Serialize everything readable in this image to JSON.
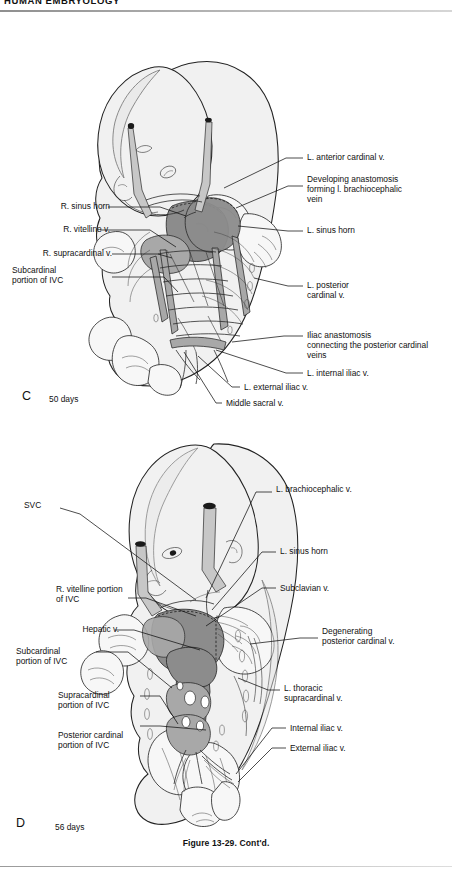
{
  "page": {
    "running_head": "HUMAN EMBRYOLOGY",
    "caption": "Figure 13-29. Cont'd."
  },
  "panels": [
    {
      "letter": "C",
      "days": "50 days",
      "labels_left": [
        {
          "text": "R. sinus horn"
        },
        {
          "text": "R. vitelline v."
        },
        {
          "text": "R. supracardinal v."
        },
        {
          "text": "Subcardinal\nportion of IVC"
        }
      ],
      "labels_right": [
        {
          "text": "L. anterior cardinal v."
        },
        {
          "text": "Developing anastomosis\nforming l. brachiocephalic\nvein"
        },
        {
          "text": "L. sinus horn"
        },
        {
          "text": "L. posterior\ncardinal v."
        },
        {
          "text": "Iliac anastomosis\nconnecting the posterior cardinal\nveins"
        },
        {
          "text": "L. internal iliac v."
        },
        {
          "text": "L. external iliac v."
        },
        {
          "text": "Middle sacral v."
        }
      ]
    },
    {
      "letter": "D",
      "days": "56 days",
      "labels_left": [
        {
          "text": "SVC"
        },
        {
          "text": "R. vitelline portion\nof IVC"
        },
        {
          "text": "Hepatic v."
        },
        {
          "text": "Subcardinal\nportion of IVC"
        },
        {
          "text": "Supracardinal\nportion of IVC"
        },
        {
          "text": "Posterior cardinal\nportion of IVC"
        }
      ],
      "labels_right": [
        {
          "text": "L. brachiocephalic v."
        },
        {
          "text": "L. sinus horn"
        },
        {
          "text": "Subclavian v."
        },
        {
          "text": "Degenerating\nposterior cardinal v."
        },
        {
          "text": "L. thoracic\nsupracardinal v."
        },
        {
          "text": "Internal iliac v."
        },
        {
          "text": "External iliac v."
        }
      ]
    }
  ],
  "colors": {
    "ink": "#111111",
    "skin": "#f1f1f1",
    "vein_dark": "#8c8c8c",
    "vein_mid": "#a8a8a8",
    "vein_light": "#c7c7c7",
    "rule": "#9a9a9a"
  }
}
